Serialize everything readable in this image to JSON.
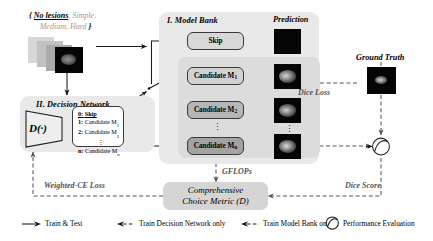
{
  "diagram": {
    "title_hidden": "Model Bank and Decision Network framework",
    "input": {
      "set_open": "{",
      "item_0": "No lesions",
      "item_0_sep": ",",
      "item_1": "Simple",
      "item_1_sep": ",",
      "item_2": "Medium",
      "item_2_sep": ",",
      "item_3": "Hard",
      "set_close": "}"
    },
    "model_bank": {
      "title": "I.  Model Bank",
      "skip_label": "Skip",
      "candidates": [
        {
          "label": "Candidate M",
          "sub": "1"
        },
        {
          "label": "Candidate M",
          "sub": "2"
        },
        {
          "label": "Candidate M",
          "sub": "n"
        }
      ],
      "vdots": "⋮"
    },
    "decision_network": {
      "title": "II.  Decision Network",
      "operator": "D(·)",
      "options": [
        {
          "key": "0:",
          "label": "Skip",
          "sub": ""
        },
        {
          "key": "1:",
          "label": "Candidate M",
          "sub": "1"
        },
        {
          "key": "2:",
          "label": "Candidate M",
          "sub": "2"
        },
        {
          "key": "n:",
          "label": "Candidate M",
          "sub": "n"
        }
      ],
      "vdots": "⋮"
    },
    "prediction": {
      "title": "Prediction",
      "vdots": "⋮"
    },
    "ground_truth": {
      "title": "Ground Truth"
    },
    "edge_labels": {
      "dice_loss": "Dice Loss",
      "dice_score": "Dice Score",
      "gflops": "GFLOPs",
      "weighted_ce_loss": "Weighted-CE Loss"
    },
    "metric": {
      "line1": "Comprehensive",
      "line2": "Choice Metric (D)"
    },
    "legend": [
      {
        "icon": "solid-arrow-icon",
        "label": "Train & Test"
      },
      {
        "icon": "dashed-arrow-left-icon",
        "label": "Train Decision Network only"
      },
      {
        "icon": "dashed-arrow-left-icon",
        "label": "Train Model Bank only"
      },
      {
        "icon": "evaluation-circle-icon",
        "label": "Performance Evaluation"
      }
    ],
    "colors": {
      "panel_bg": "#e9e9e9",
      "panel_inner_bg": "#dcdcdc",
      "box_skip": "#d8d8d8",
      "box_candidate_1": "#d2d2d2",
      "box_candidate_2": "#b6b6b6",
      "box_candidate_n": "#a3a3a3",
      "metric_bg": "#d5d5d5",
      "stroke": "#3a3a3a",
      "muted_text": "#9b9b9b"
    }
  }
}
